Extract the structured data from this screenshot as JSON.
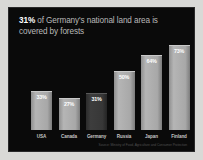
{
  "slide": {
    "headline_highlight": "31%",
    "headline_rest": " of Germany's national land area is covered by forests",
    "source_note": "Source: Ministry of Food, Agriculture and Consumer Protection",
    "background_color": "#0a0a0a",
    "bar_color": "#a8a8a8",
    "highlight_bar_color": "#373737",
    "text_color": "#b9b9b9",
    "highlight_text_color": "#ffffff"
  },
  "chart_data": {
    "type": "bar",
    "title": "31% of Germany's national land area is covered by forests",
    "xlabel": "",
    "ylabel": "",
    "ylim": [
      0,
      80
    ],
    "grid": false,
    "legend": "none",
    "categories": [
      "USA",
      "Canada",
      "Germany",
      "Russia",
      "Japan",
      "Finland"
    ],
    "values": [
      33,
      27,
      31,
      50,
      64,
      73
    ],
    "value_labels": [
      "33%",
      "27%",
      "31%",
      "50%",
      "64%",
      "73%"
    ],
    "highlighted_category": "Germany"
  }
}
